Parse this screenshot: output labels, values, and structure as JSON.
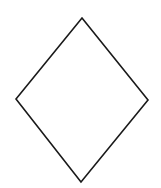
{
  "diagram": {
    "shape": "rhombus",
    "stroke_color": "#1a1a1a",
    "fill_color": "#ffffff",
    "stroke_width": 1.6,
    "vertices": {
      "top": [
        82,
        18
      ],
      "right": [
        148,
        100
      ],
      "bottom": [
        81,
        182
      ],
      "left": [
        16,
        99
      ]
    }
  }
}
